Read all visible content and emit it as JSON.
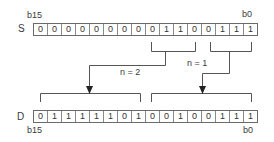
{
  "diagram": {
    "source": {
      "name": "S",
      "msb_label": "b15",
      "lsb_label": "b0",
      "bits": [
        "0",
        "0",
        "0",
        "0",
        "0",
        "0",
        "0",
        "0",
        "0",
        "1",
        "1",
        "0",
        "0",
        "1",
        "1",
        "1"
      ]
    },
    "destination": {
      "name": "D",
      "msb_label": "b15",
      "lsb_label": "b0",
      "bits": [
        "0",
        "1",
        "1",
        "1",
        "1",
        "1",
        "0",
        "1",
        "0",
        "0",
        "1",
        "0",
        "0",
        "1",
        "1",
        "1"
      ]
    },
    "arrows": [
      {
        "label": "n = 2"
      },
      {
        "label": "n = 1"
      }
    ],
    "colors": {
      "line": "#555555",
      "text": "#333333",
      "background": "#ffffff"
    }
  }
}
